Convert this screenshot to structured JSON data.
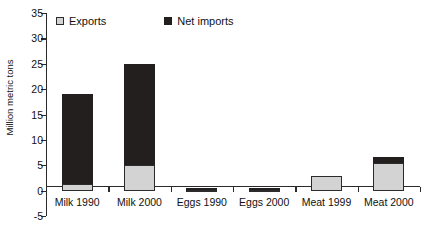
{
  "chart_data": {
    "type": "bar",
    "title": "",
    "subtitle": "",
    "xlabel": "",
    "ylabel": "Million metric tons",
    "ylim": [
      -5,
      35
    ],
    "ytick_step": 5,
    "yticks": [
      35,
      30,
      25,
      20,
      15,
      10,
      5,
      0,
      -5
    ],
    "ytick_labels": [
      "35",
      "30",
      "25",
      "20",
      "15",
      "10",
      "5",
      "0",
      "-5"
    ],
    "grid": false,
    "stacked": true,
    "legend_position": "top",
    "categories": [
      "Milk 1990",
      "Milk 2000",
      "Eggs 1990",
      "Eggs 2000",
      "Meat 1999",
      "Meat 2000"
    ],
    "series": [
      {
        "name": "Exports",
        "color": "#d3d3d3",
        "values": [
          1.3,
          5.0,
          0.2,
          0.15,
          2.8,
          5.5
        ]
      },
      {
        "name": "Net imports",
        "color": "#231f1e",
        "values": [
          17.7,
          20.0,
          0.35,
          0.4,
          0.0,
          1.1
        ]
      }
    ],
    "totals": [
      19.0,
      25.0,
      0.55,
      0.55,
      2.8,
      6.6
    ],
    "annotations": []
  },
  "legend": {
    "items": [
      {
        "label": "Exports",
        "swatch": "exports"
      },
      {
        "label": "Net imports",
        "swatch": "imports"
      }
    ]
  },
  "axis": {
    "y_title": "Million metric tons"
  }
}
